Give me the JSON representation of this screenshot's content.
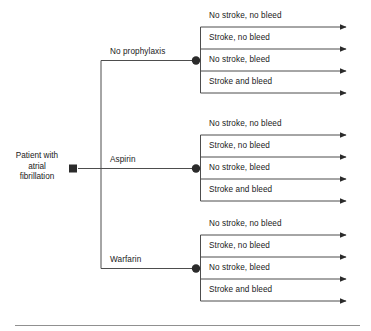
{
  "figure": {
    "type": "decision-tree",
    "root": {
      "lines": [
        "Patient with",
        "atrial",
        "fibrillation"
      ],
      "node_type": "decision-square"
    },
    "branches": [
      {
        "label": "No prophylaxis",
        "node_type": "chance-circle",
        "outcomes": [
          "No stroke, no bleed",
          "Stroke, no bleed",
          "No stroke, bleed",
          "Stroke and bleed"
        ]
      },
      {
        "label": "Aspirin",
        "node_type": "chance-circle",
        "outcomes": [
          "No stroke, no bleed",
          "Stroke, no bleed",
          "No stroke, bleed",
          "Stroke and bleed"
        ]
      },
      {
        "label": "Warfarin",
        "node_type": "chance-circle",
        "outcomes": [
          "No stroke, no bleed",
          "Stroke, no bleed",
          "No stroke, bleed",
          "Stroke and bleed"
        ]
      }
    ],
    "colors": {
      "line": "#4d4d4d",
      "node": "#1a1a1a",
      "text": "#1a1a1a",
      "rule": "#808080",
      "background": "#ffffff"
    }
  }
}
